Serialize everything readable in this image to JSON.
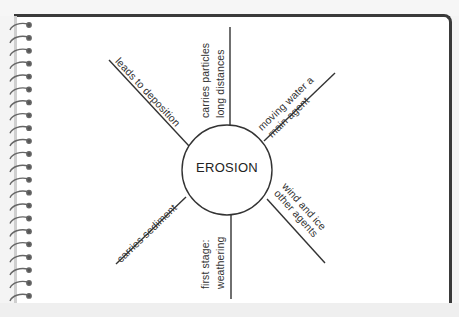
{
  "diagram": {
    "type": "concept-web",
    "center": {
      "label": "EROSION"
    },
    "spokes": [
      {
        "id": "top",
        "lines": [
          "carries particles",
          "long distances"
        ]
      },
      {
        "id": "upper-right",
        "lines": [
          "moving water a",
          "main agent"
        ]
      },
      {
        "id": "lower-right",
        "lines": [
          "wind and ice",
          "other agents"
        ]
      },
      {
        "id": "bottom",
        "lines": [
          "first stage:",
          "weathering"
        ]
      },
      {
        "id": "lower-left",
        "lines": [
          "carries sediment"
        ]
      },
      {
        "id": "upper-left",
        "lines": [
          "leads to deposition"
        ]
      }
    ]
  },
  "colors": {
    "ink": "#333333",
    "paper": "#ffffff",
    "border": "#3a3a3a",
    "spiral": "#555555"
  }
}
